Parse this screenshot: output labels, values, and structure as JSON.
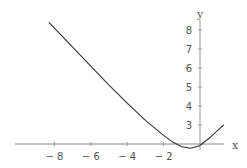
{
  "chart_data": {
    "type": "line",
    "title": "",
    "xlabel": "x",
    "ylabel": "y",
    "xlim": [
      -9,
      1.4
    ],
    "ylim": [
      2,
      8.5
    ],
    "x_ticks": [
      -8,
      -6,
      -4,
      -2
    ],
    "x_tick_labels": [
      "-8",
      "-6",
      "-4",
      "-2"
    ],
    "y_ticks": [
      3,
      4,
      5,
      6,
      7,
      8
    ],
    "y_tick_labels": [
      "3",
      "4",
      "5",
      "6",
      "7",
      "8"
    ],
    "axes_origin": {
      "x": 0,
      "y": 2
    },
    "grid": false,
    "legend": null,
    "series": [
      {
        "name": "curve",
        "color": "#333333",
        "x": [
          -8.3,
          -7,
          -6,
          -5,
          -4,
          -3,
          -2,
          -1.5,
          -1,
          -0.5,
          0,
          0.5,
          1,
          1.3
        ],
        "y": [
          8.4,
          7.1,
          6.1,
          5.1,
          4.15,
          3.25,
          2.45,
          2.1,
          1.85,
          1.78,
          1.92,
          2.3,
          2.75,
          3.0
        ]
      }
    ]
  }
}
